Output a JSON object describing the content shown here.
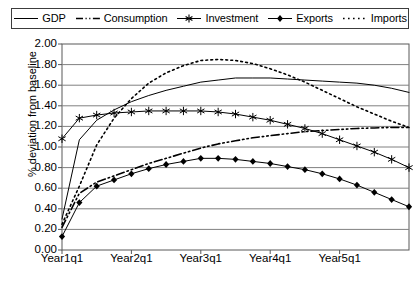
{
  "chart_data": {
    "type": "line",
    "title": "",
    "xlabel": "",
    "ylabel": "% deviation from baseline",
    "ylim": [
      0.0,
      2.0
    ],
    "ytick_step": 0.2,
    "yticks": [
      "0.00",
      "0.20",
      "0.40",
      "0.60",
      "0.80",
      "1.00",
      "1.20",
      "1.40",
      "1.60",
      "1.80",
      "2.00"
    ],
    "xticks": [
      "Year1q1",
      "Year2q1",
      "Year3q1",
      "Year4q1",
      "Year5q1"
    ],
    "xtick_indices": [
      0,
      4,
      8,
      12,
      16
    ],
    "x": [
      0,
      1,
      2,
      3,
      4,
      5,
      6,
      7,
      8,
      9,
      10,
      11,
      12,
      13,
      14,
      15,
      16,
      17,
      18,
      19,
      20
    ],
    "grid": "horizontal",
    "legend_position": "top",
    "series": [
      {
        "name": "GDP",
        "style": "solid",
        "marker": "none",
        "color": "#000000",
        "values": [
          0.3,
          1.07,
          1.26,
          1.36,
          1.44,
          1.5,
          1.55,
          1.59,
          1.63,
          1.65,
          1.67,
          1.67,
          1.67,
          1.66,
          1.65,
          1.64,
          1.63,
          1.62,
          1.6,
          1.57,
          1.53
        ]
      },
      {
        "name": "Consumption",
        "style": "dash-dot",
        "marker": "none",
        "color": "#000000",
        "values": [
          0.22,
          0.55,
          0.66,
          0.72,
          0.78,
          0.84,
          0.89,
          0.94,
          0.99,
          1.03,
          1.06,
          1.09,
          1.11,
          1.13,
          1.15,
          1.16,
          1.17,
          1.18,
          1.185,
          1.19,
          1.19
        ]
      },
      {
        "name": "Investment",
        "style": "solid",
        "marker": "asterisk",
        "color": "#000000",
        "values": [
          1.08,
          1.28,
          1.31,
          1.33,
          1.34,
          1.35,
          1.35,
          1.35,
          1.35,
          1.34,
          1.32,
          1.29,
          1.26,
          1.22,
          1.18,
          1.13,
          1.07,
          1.01,
          0.95,
          0.88,
          0.8
        ]
      },
      {
        "name": "Exports",
        "style": "solid",
        "marker": "diamond",
        "color": "#000000",
        "values": [
          0.13,
          0.46,
          0.62,
          0.68,
          0.74,
          0.79,
          0.83,
          0.86,
          0.89,
          0.89,
          0.88,
          0.86,
          0.84,
          0.81,
          0.78,
          0.74,
          0.69,
          0.63,
          0.56,
          0.49,
          0.42
        ]
      },
      {
        "name": "Imports",
        "style": "dotted",
        "marker": "none",
        "color": "#000000",
        "values": [
          0.25,
          0.62,
          1.02,
          1.28,
          1.47,
          1.62,
          1.72,
          1.79,
          1.84,
          1.85,
          1.84,
          1.81,
          1.76,
          1.7,
          1.63,
          1.55,
          1.47,
          1.39,
          1.32,
          1.25,
          1.19
        ]
      }
    ]
  },
  "legend": {
    "items": [
      {
        "label": "GDP",
        "key": "line-solid-key"
      },
      {
        "label": "Consumption",
        "key": "line-dashdot-key"
      },
      {
        "label": "Investment",
        "key": "line-asterisk-key"
      },
      {
        "label": "Exports",
        "key": "line-diamond-key"
      },
      {
        "label": "Imports",
        "key": "line-dotted-key"
      }
    ]
  }
}
